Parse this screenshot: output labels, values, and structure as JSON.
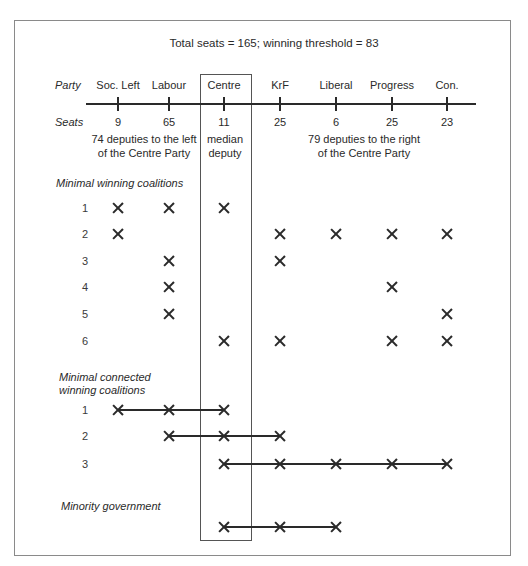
{
  "title": "Total seats = 165; winning threshold = 83",
  "labels": {
    "party": "Party",
    "seats": "Seats"
  },
  "parties": [
    {
      "name": "Soc. Left",
      "seats": "9",
      "x": 118
    },
    {
      "name": "Labour",
      "seats": "65",
      "x": 169
    },
    {
      "name": "Centre",
      "seats": "11",
      "x": 224
    },
    {
      "name": "KrF",
      "seats": "25",
      "x": 280
    },
    {
      "name": "Liberal",
      "seats": "6",
      "x": 336
    },
    {
      "name": "Progress",
      "seats": "25",
      "x": 392
    },
    {
      "name": "Con.",
      "seats": "23",
      "x": 447
    }
  ],
  "annotations": {
    "left_line1": "74 deputies to the left",
    "left_line2": "of the Centre Party",
    "median_line1": "median",
    "median_line2": "deputy",
    "right_line1": "79 deputies to the right",
    "right_line2": "of the Centre Party"
  },
  "sections": {
    "minimal_winning": {
      "title": "Minimal winning coalitions",
      "rows": [
        {
          "label": "1",
          "y": 208,
          "parties": [
            0,
            1,
            2
          ]
        },
        {
          "label": "2",
          "y": 234,
          "parties": [
            0,
            3,
            4,
            5,
            6
          ]
        },
        {
          "label": "3",
          "y": 261,
          "parties": [
            1,
            3
          ]
        },
        {
          "label": "4",
          "y": 287,
          "parties": [
            1,
            5
          ]
        },
        {
          "label": "5",
          "y": 314,
          "parties": [
            1,
            6
          ]
        },
        {
          "label": "6",
          "y": 341,
          "parties": [
            2,
            3,
            5,
            6
          ]
        }
      ]
    },
    "minimal_connected": {
      "title_line1": "Minimal connected",
      "title_line2": "winning coalitions",
      "rows": [
        {
          "label": "1",
          "y": 410,
          "parties": [
            0,
            1,
            2
          ]
        },
        {
          "label": "2",
          "y": 436,
          "parties": [
            1,
            2,
            3
          ]
        },
        {
          "label": "3",
          "y": 464,
          "parties": [
            2,
            3,
            4,
            5,
            6
          ]
        }
      ]
    },
    "minority": {
      "title": "Minority government",
      "rows": [
        {
          "label": "",
          "y": 527,
          "parties": [
            2,
            3,
            4
          ]
        }
      ]
    }
  },
  "colors": {
    "ink": "#2a2a2a",
    "frame": "#8a8a8a",
    "background": "#ffffff"
  }
}
